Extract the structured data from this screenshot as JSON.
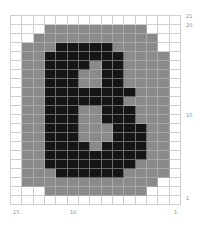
{
  "chart": {
    "columns": 15,
    "rows": 21,
    "colors": {
      "W": "#ffffff",
      "G": "#8a8a8a",
      "B": "#161616",
      "gridline": "#cfcfcf"
    },
    "grid": [
      "WWWWWWWWWWWWWWW",
      "WWWGGGGGGGGGWWW",
      "WWGGGGGGGGGGGWW",
      "WGGGBBBBBGGGGWW",
      "WGGBBBBBBBGGGGW",
      "WGGBBBBGBBGGGGW",
      "WGGBBBGGBBGGGGW",
      "WGGBBBGGBBGGGGW",
      "WGGBBBBBBBBGGGW",
      "WGGBBBBBBBGGGGW",
      "WGGBBBGGBBBGGGW",
      "WGGBBBGGBBBGGGW",
      "WGGBBBGGGBBBGGW",
      "WGGBBBGGGBBBGGW",
      "WGGBBBBGBBBBGGW",
      "WGGBBBBBBBBBGGW",
      "WGGBBBBBBBBGGGW",
      "WGGGBBBBBBGGGGW",
      "WGGGGGGGGGGGGWW",
      "WWWGGGGGGGGGWWW",
      "WWWWWWWWWWWWWWW"
    ]
  },
  "labels": {
    "right": [
      {
        "text": "21",
        "top": 14
      },
      {
        "text": "20",
        "top": 23
      },
      {
        "text": "10",
        "top": 113
      },
      {
        "text": "1",
        "top": 196
      }
    ],
    "bottom": [
      {
        "text": "15",
        "left": 13
      },
      {
        "text": "10",
        "left": 70
      },
      {
        "text": "1",
        "left": 174
      }
    ]
  }
}
